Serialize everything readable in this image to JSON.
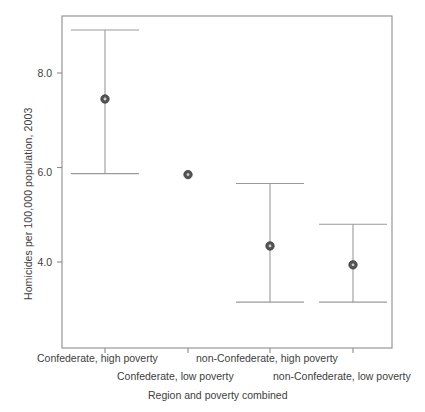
{
  "chart_data": {
    "type": "scatter",
    "title": "",
    "xlabel": "Region and poverty combined",
    "ylabel": "Homicides per 100,000 population, 2003",
    "categories": [
      "Confederate, high poverty",
      "Confederate, low poverty",
      "non-Confederate, high poverty",
      "non-Confederate, low poverty"
    ],
    "values": [
      7.45,
      5.85,
      4.34,
      3.94
    ],
    "error_low": [
      5.87,
      5.85,
      3.15,
      3.15
    ],
    "error_high": [
      8.91,
      5.85,
      5.66,
      4.8
    ],
    "ytick_labels": [
      "4.0",
      "6.0",
      "8.0"
    ],
    "ytick_values": [
      4.0,
      6.0,
      8.0
    ],
    "ylim": [
      2.7,
      9.05
    ],
    "grid": false,
    "legend": null,
    "marker_color": "#555555",
    "line_color": "#9a9a9a",
    "frame_color": "#8c8c8c"
  },
  "axis": {
    "ylabel_text": "Homicides per 100,000 population, 2003",
    "xlabel_text": "Region and poverty combined",
    "yticks": [
      {
        "label": "4.0",
        "value": 4.0
      },
      {
        "label": "6.0",
        "value": 6.0
      },
      {
        "label": "8.0",
        "value": 8.0
      }
    ]
  },
  "xcategories": [
    {
      "label": "Confederate, high poverty",
      "row": 0
    },
    {
      "label": "Confederate, low poverty",
      "row": 1
    },
    {
      "label": "non-Confederate, high poverty",
      "row": 0
    },
    {
      "label": "non-Confederate, low poverty",
      "row": 1
    }
  ]
}
